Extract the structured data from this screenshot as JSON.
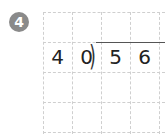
{
  "problem": {
    "number": "4",
    "divisor": [
      "4",
      "0"
    ],
    "dividend": [
      "5",
      "6"
    ],
    "bracket": ")",
    "badge_color": "#8a8a8a",
    "grid": {
      "columns": 4,
      "rows": 4
    }
  }
}
